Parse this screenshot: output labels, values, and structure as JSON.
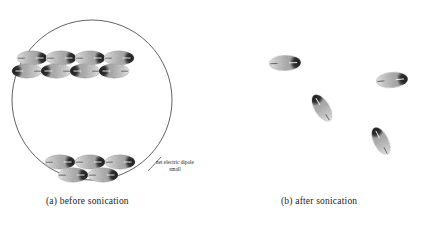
{
  "figure": {
    "title_alt": "Schematic of dipolar particle aggregation before and after sonication",
    "background_color": "#ffffff",
    "ink_color": "#1c1c1c"
  },
  "panel_a": {
    "caption": "(a) before sonication",
    "container": {
      "shape": "circle",
      "center_x": 92,
      "center_y": 100,
      "radius": 80,
      "stroke_color": "#3a3a3a",
      "stroke_width": 0.8
    },
    "annotation": {
      "line1": "net electric dipole",
      "line2": "small",
      "leader_from_x": 150,
      "leader_from_y": 170,
      "leader_to_x": 160,
      "leader_to_y": 158
    },
    "cluster_top": {
      "label": "antiparallel chain aggregate",
      "rows": [
        {
          "y": 58,
          "polarity": "right",
          "particles": [
            {
              "cx": 32,
              "cy": 58
            },
            {
              "cx": 61,
              "cy": 58
            },
            {
              "cx": 90,
              "cy": 58
            },
            {
              "cx": 119,
              "cy": 58
            }
          ]
        },
        {
          "y": 70,
          "polarity": "left",
          "particles": [
            {
              "cx": 27,
              "cy": 70
            },
            {
              "cx": 56,
              "cy": 70
            },
            {
              "cx": 85,
              "cy": 70
            },
            {
              "cx": 114,
              "cy": 70
            }
          ]
        }
      ]
    },
    "cluster_bottom": {
      "label": "antiparallel chain aggregate",
      "rows": [
        {
          "y": 162,
          "polarity": "right",
          "particles": [
            {
              "cx": 60,
              "cy": 162
            },
            {
              "cx": 90,
              "cy": 162
            },
            {
              "cx": 120,
              "cy": 162
            }
          ]
        },
        {
          "y": 174,
          "polarity": "right",
          "particles": [
            {
              "cx": 73,
              "cy": 174
            },
            {
              "cx": 103,
              "cy": 174
            }
          ]
        }
      ]
    }
  },
  "panel_b": {
    "caption": "(b) after sonication",
    "particles": [
      {
        "cx": 285,
        "cy": 63,
        "angle": -2,
        "polarity": "right",
        "rx": 27,
        "ry": 10
      },
      {
        "cx": 392,
        "cy": 80,
        "angle": -5,
        "polarity": "right",
        "rx": 27,
        "ry": 10
      },
      {
        "cx": 322,
        "cy": 108,
        "angle": 58,
        "polarity": "left",
        "rx": 25,
        "ry": 9
      },
      {
        "cx": 381,
        "cy": 141,
        "angle": 63,
        "polarity": "left",
        "rx": 24,
        "ry": 9
      }
    ]
  },
  "particle_style": {
    "body_light": "#e8e8e8",
    "body_mid": "#b9b9b9",
    "body_dark": "#8f8f8f",
    "cap_color": "#2e2e2e",
    "tick_color": "#f2f2f2",
    "outline_color": "#9a9a9a"
  }
}
